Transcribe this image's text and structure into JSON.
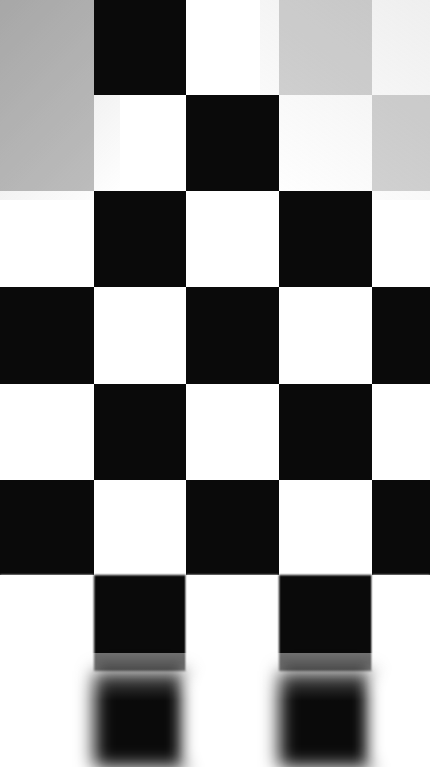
{
  "image": {
    "subject": "checkerboard-calibration-target",
    "width": 430,
    "height": 767,
    "columns": 5,
    "rows": 8,
    "column_edges": [
      0,
      94,
      186,
      279,
      372,
      430
    ],
    "row_edges": [
      0,
      95,
      191,
      287,
      384,
      480,
      575,
      671,
      767
    ],
    "background_color": "#ffffff"
  },
  "palette": {
    "black": "#0a0a0a",
    "white": "#ffffff",
    "gray_medium": "#bfbfbf",
    "gray_light": "#d4d4d4",
    "gray_faint": "#ededed"
  },
  "focus": {
    "sharp_rows": [
      0,
      1,
      2,
      3,
      4,
      5
    ],
    "soft_rows": [
      6
    ],
    "defocused_rows": [
      7
    ],
    "note": "depth-of-field falloff toward bottom of frame"
  },
  "grid": {
    "cells": [
      {
        "row": 0,
        "col": 0,
        "color": "#bfbfbf",
        "blur": "sharp"
      },
      {
        "row": 0,
        "col": 1,
        "color": "#0a0a0a",
        "blur": "sharp"
      },
      {
        "row": 0,
        "col": 2,
        "color": "#ffffff",
        "blur": "sharp"
      },
      {
        "row": 0,
        "col": 3,
        "color": "#d4d4d4",
        "blur": "sharp"
      },
      {
        "row": 0,
        "col": 4,
        "color": "#ffffff",
        "blur": "sharp"
      },
      {
        "row": 1,
        "col": 0,
        "color": "#bfbfbf",
        "blur": "sharp"
      },
      {
        "row": 1,
        "col": 1,
        "color": "#ffffff",
        "blur": "sharp"
      },
      {
        "row": 1,
        "col": 2,
        "color": "#0a0a0a",
        "blur": "sharp"
      },
      {
        "row": 1,
        "col": 3,
        "color": "#ffffff",
        "blur": "sharp"
      },
      {
        "row": 1,
        "col": 4,
        "color": "#d4d4d4",
        "blur": "sharp"
      },
      {
        "row": 2,
        "col": 0,
        "color": "#ffffff",
        "blur": "sharp"
      },
      {
        "row": 2,
        "col": 1,
        "color": "#0a0a0a",
        "blur": "sharp"
      },
      {
        "row": 2,
        "col": 2,
        "color": "#ffffff",
        "blur": "sharp"
      },
      {
        "row": 2,
        "col": 3,
        "color": "#0a0a0a",
        "blur": "sharp"
      },
      {
        "row": 2,
        "col": 4,
        "color": "#ffffff",
        "blur": "sharp"
      },
      {
        "row": 3,
        "col": 0,
        "color": "#0a0a0a",
        "blur": "sharp"
      },
      {
        "row": 3,
        "col": 1,
        "color": "#ffffff",
        "blur": "sharp"
      },
      {
        "row": 3,
        "col": 2,
        "color": "#0a0a0a",
        "blur": "sharp"
      },
      {
        "row": 3,
        "col": 3,
        "color": "#ffffff",
        "blur": "sharp"
      },
      {
        "row": 3,
        "col": 4,
        "color": "#0a0a0a",
        "blur": "sharp"
      },
      {
        "row": 4,
        "col": 0,
        "color": "#ffffff",
        "blur": "sharp"
      },
      {
        "row": 4,
        "col": 1,
        "color": "#0a0a0a",
        "blur": "sharp"
      },
      {
        "row": 4,
        "col": 2,
        "color": "#ffffff",
        "blur": "sharp"
      },
      {
        "row": 4,
        "col": 3,
        "color": "#0a0a0a",
        "blur": "sharp"
      },
      {
        "row": 4,
        "col": 4,
        "color": "#ffffff",
        "blur": "sharp"
      },
      {
        "row": 5,
        "col": 0,
        "color": "#0a0a0a",
        "blur": "sharp"
      },
      {
        "row": 5,
        "col": 1,
        "color": "#ffffff",
        "blur": "sharp"
      },
      {
        "row": 5,
        "col": 2,
        "color": "#0a0a0a",
        "blur": "sharp"
      },
      {
        "row": 5,
        "col": 3,
        "color": "#ffffff",
        "blur": "sharp"
      },
      {
        "row": 5,
        "col": 4,
        "color": "#0a0a0a",
        "blur": "sharp"
      },
      {
        "row": 6,
        "col": 0,
        "color": "#ffffff",
        "blur": "blur-1"
      },
      {
        "row": 6,
        "col": 1,
        "color": "#0a0a0a",
        "blur": "blur-1"
      },
      {
        "row": 6,
        "col": 2,
        "color": "#ffffff",
        "blur": "blur-1"
      },
      {
        "row": 6,
        "col": 3,
        "color": "#0a0a0a",
        "blur": "blur-1"
      },
      {
        "row": 6,
        "col": 4,
        "color": "#ffffff",
        "blur": "blur-1"
      },
      {
        "row": 7,
        "col": 0,
        "color": "#ffffff",
        "blur": "blur-3"
      },
      {
        "row": 7,
        "col": 1,
        "color": "#0a0a0a",
        "blur": "blur-3"
      },
      {
        "row": 7,
        "col": 2,
        "color": "#ffffff",
        "blur": "blur-3"
      },
      {
        "row": 7,
        "col": 3,
        "color": "#0a0a0a",
        "blur": "blur-3"
      },
      {
        "row": 7,
        "col": 4,
        "color": "#ffffff",
        "blur": "blur-3"
      }
    ]
  },
  "shading": [
    {
      "name": "upper-left-falloff",
      "x": 0,
      "y": 0,
      "width": 120,
      "height": 200,
      "gradient": "linear-gradient(135deg, rgba(150,150,150,0.30), rgba(255,255,255,0))"
    },
    {
      "name": "upper-right-falloff",
      "x": 260,
      "y": 0,
      "width": 170,
      "height": 200,
      "gradient": "linear-gradient(215deg, rgba(180,180,180,0.22), rgba(255,255,255,0))"
    }
  ]
}
